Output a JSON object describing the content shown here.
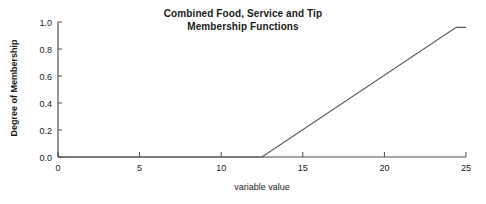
{
  "chart_data": {
    "type": "line",
    "title": "Combined Food, Service and Tip\nMembership Functions",
    "xlabel": "variable value",
    "ylabel": "Degree of Membership",
    "xlim": [
      0,
      25
    ],
    "ylim": [
      0.0,
      1.0
    ],
    "xticks": [
      0,
      5,
      10,
      15,
      20,
      25
    ],
    "xticklabels": [
      "0",
      "5",
      "10",
      "15",
      "20",
      "25"
    ],
    "yticks": [
      0.0,
      0.2,
      0.4,
      0.6,
      0.8,
      1.0
    ],
    "yticklabels": [
      "0.0",
      "0.2",
      "0.4",
      "0.6",
      "0.8",
      "1.0"
    ],
    "grid": false,
    "legend": false,
    "line_color": "#555555",
    "axis_color": "#4d4d4d",
    "background": "#ffffff",
    "series": [
      {
        "name": "combined membership",
        "x": [
          0,
          12.5,
          24.4,
          25
        ],
        "values": [
          0.0,
          0.0,
          0.96,
          0.96
        ]
      }
    ],
    "annotations": []
  },
  "figure": {
    "width": 486,
    "height": 204
  }
}
